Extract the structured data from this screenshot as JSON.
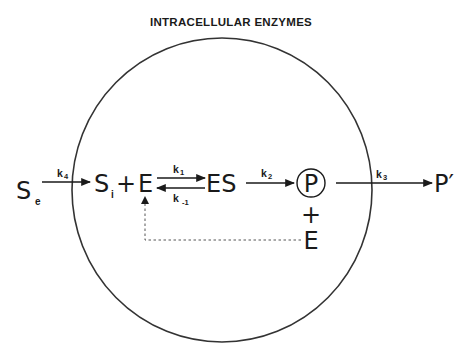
{
  "title": "INTRACELLULAR ENZYMES",
  "colors": {
    "ink": "#1a1a1a",
    "cell_outline": "#333333",
    "dashed": "#555555",
    "background": "#ffffff"
  },
  "nodes": {
    "substrate_external": {
      "label": "S",
      "subscript": "e"
    },
    "substrate_internal": {
      "label": "S",
      "subscript": "i"
    },
    "plus_1": "+",
    "enzyme": "E",
    "complex": "ES",
    "product": "P",
    "plus_2": "+",
    "enzyme_released": "E",
    "product_external": "P′"
  },
  "rate_constants": {
    "k4": {
      "label": "k",
      "subscript": "4"
    },
    "k1": {
      "label": "k",
      "subscript": "1"
    },
    "k_minus_1": {
      "label": "k",
      "subscript": "-1"
    },
    "k2": {
      "label": "k",
      "subscript": "2"
    },
    "k3": {
      "label": "k",
      "subscript": "3"
    }
  }
}
